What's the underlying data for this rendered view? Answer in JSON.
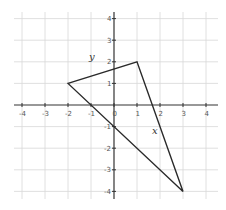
{
  "chart_data": {
    "type": "line",
    "title": "",
    "xlabel": "x",
    "ylabel": "y",
    "xlim": [
      -4,
      4
    ],
    "ylim": [
      -4,
      4
    ],
    "grid": true,
    "x_ticks": [
      -4,
      -3,
      -2,
      -1,
      0,
      1,
      2,
      3,
      4
    ],
    "y_ticks": [
      -4,
      -3,
      -2,
      -1,
      1,
      2,
      3,
      4
    ],
    "x_tick_labels": [
      "-4",
      "-3",
      "-2",
      "-1",
      "0",
      "1",
      "2",
      "3",
      "4"
    ],
    "y_tick_labels": [
      "-4",
      "-3",
      "-2",
      "-1",
      "1",
      "2",
      "3",
      "4"
    ],
    "series": [
      {
        "name": "triangle",
        "closed": true,
        "points": [
          [
            -2,
            1
          ],
          [
            1,
            2
          ],
          [
            3,
            -4
          ]
        ]
      }
    ],
    "colors": {
      "grid": "#d8d8d8",
      "axis": "#333333",
      "shape": "#2a2a2a"
    }
  }
}
